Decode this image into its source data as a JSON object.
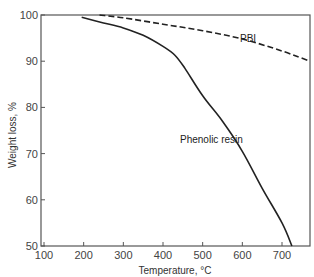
{
  "chart_data": {
    "type": "line",
    "title": "",
    "xlabel": "Temperature, °C",
    "ylabel": "Weight loss, %",
    "xlim": [
      95,
      770
    ],
    "ylim": [
      50,
      100
    ],
    "x_ticks": [
      100,
      200,
      300,
      400,
      500,
      600,
      700
    ],
    "y_ticks": [
      50,
      60,
      70,
      80,
      90,
      100
    ],
    "grid": false,
    "legend": "inline labels",
    "series": [
      {
        "name": "PBI",
        "style": "dashed",
        "color": "#222222",
        "label_position": {
          "x": 600,
          "y": 94.5
        },
        "points": [
          [
            240,
            100
          ],
          [
            300,
            99.4
          ],
          [
            400,
            98.0
          ],
          [
            500,
            96.6
          ],
          [
            600,
            94.8
          ],
          [
            700,
            92.2
          ],
          [
            770,
            90.0
          ]
        ]
      },
      {
        "name": "Phenolic resin",
        "style": "solid",
        "color": "#222222",
        "label_position": {
          "x": 490,
          "y": 73
        },
        "points": [
          [
            195,
            99.5
          ],
          [
            250,
            98.3
          ],
          [
            300,
            97.2
          ],
          [
            350,
            95.6
          ],
          [
            400,
            93.2
          ],
          [
            430,
            91.3
          ],
          [
            455,
            88.5
          ],
          [
            500,
            82.5
          ],
          [
            550,
            77.0
          ],
          [
            600,
            70.5
          ],
          [
            650,
            62.5
          ],
          [
            700,
            55.0
          ],
          [
            725,
            50.0
          ]
        ]
      }
    ]
  },
  "axes": {
    "x_title": "Temperature, °C",
    "y_title": "Weight loss, %",
    "x_tick_labels": [
      "100",
      "200",
      "300",
      "400",
      "500",
      "600",
      "700"
    ],
    "y_tick_labels": [
      "50",
      "60",
      "70",
      "80",
      "90",
      "100"
    ]
  },
  "labels": {
    "pbi": "PBI",
    "phenolic": "Phenolic resin"
  }
}
